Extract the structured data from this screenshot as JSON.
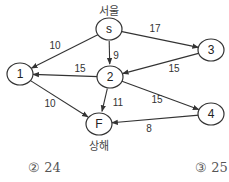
{
  "diagram": {
    "nodes": [
      {
        "id": "s",
        "label": "s",
        "x": 109,
        "y": 29,
        "city": "서울",
        "city_pos": "above"
      },
      {
        "id": "1",
        "label": "1",
        "x": 20,
        "y": 74
      },
      {
        "id": "2",
        "label": "2",
        "x": 110,
        "y": 77
      },
      {
        "id": "3",
        "label": "3",
        "x": 211,
        "y": 50
      },
      {
        "id": "4",
        "label": "4",
        "x": 211,
        "y": 114
      },
      {
        "id": "F",
        "label": "F",
        "x": 99,
        "y": 124,
        "city": "상해",
        "city_pos": "below"
      }
    ],
    "edges": [
      {
        "from": "s",
        "to": "1",
        "weight": "10",
        "lx": 55,
        "ly": 45
      },
      {
        "from": "s",
        "to": "2",
        "weight": "9",
        "lx": 116,
        "ly": 55
      },
      {
        "from": "s",
        "to": "3",
        "weight": "17",
        "lx": 155,
        "ly": 28
      },
      {
        "from": "2",
        "to": "1",
        "weight": "15",
        "lx": 80,
        "ly": 68
      },
      {
        "from": "3",
        "to": "2",
        "weight": "15",
        "lx": 174,
        "ly": 68
      },
      {
        "from": "1",
        "to": "F",
        "weight": "10",
        "lx": 50,
        "ly": 103
      },
      {
        "from": "2",
        "to": "F",
        "weight": "11",
        "lx": 118,
        "ly": 102
      },
      {
        "from": "2",
        "to": "4",
        "weight": "15",
        "lx": 157,
        "ly": 99
      },
      {
        "from": "4",
        "to": "F",
        "weight": "8",
        "lx": 149,
        "ly": 128
      }
    ],
    "node_radius": 12
  },
  "labels": {
    "source_city": "서울",
    "sink_city": "상해"
  },
  "choices": [
    {
      "marker": "②",
      "value": "24",
      "text": "② 24"
    },
    {
      "marker": "③",
      "value": "25",
      "text": "③ 25"
    }
  ]
}
